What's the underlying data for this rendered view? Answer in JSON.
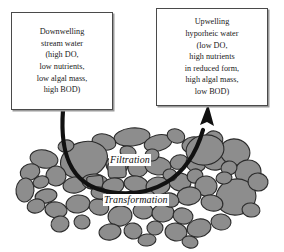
{
  "figure": {
    "background_color": "#ffffff"
  },
  "callouts": {
    "downwelling": {
      "name": "Downwelling stream water callout",
      "lines": [
        "Downwelling",
        "stream water",
        "(high DO,",
        "low nutrients,",
        "low algal mass,",
        "high BOD)"
      ],
      "border_color": "#4a4a4a",
      "background_color": "#ffffff"
    },
    "upwelling": {
      "name": "Upwelling hyporheic water callout",
      "lines": [
        "Upwelling",
        "hyporheic water",
        "(low DO,",
        "high nutrients",
        "in reduced form,",
        "high algal mass,",
        "low BOD)"
      ],
      "border_color": "#4a4a4a",
      "background_color": "#ffffff"
    }
  },
  "bed_labels": [
    {
      "text": "Filtration",
      "style": "italic"
    },
    {
      "text": "Transformation",
      "style": "italic"
    }
  ],
  "flow_arrow": {
    "name": "hyporheic-flow-arrow",
    "from": "Downwelling stream water",
    "to": "Upwelling hyporheic water",
    "color": "#111111",
    "direction": "down-through-bed-then-up"
  },
  "sediment_bed": {
    "name": "streambed sediment",
    "rock_fill": "#8d8d8d",
    "rock_stroke": "#2b2b2b",
    "rock_count": 72
  }
}
